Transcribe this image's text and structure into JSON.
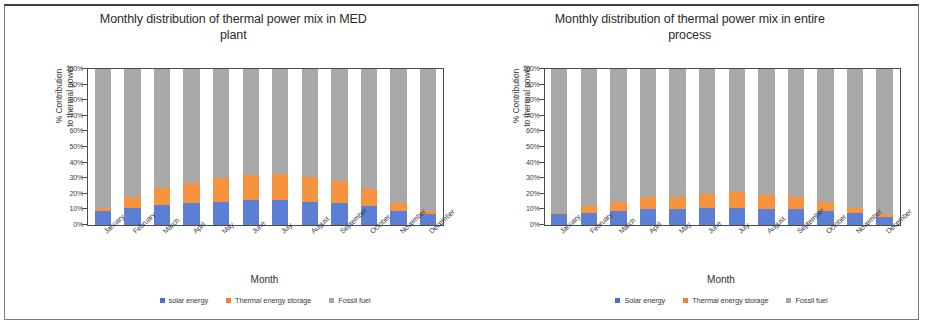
{
  "figure": {
    "panels": [
      {
        "id": "med-plant",
        "title": "Monthly distribution of thermal power mix in MED plant",
        "title_line1": "Monthly distribution of thermal power mix in MED",
        "title_line2": "plant",
        "ylabel_line1": "% Contribution",
        "ylabel_line2": "to thermal power",
        "xlabel": "Month",
        "legend": [
          {
            "label": "solar energy",
            "color": "#4a6fc8"
          },
          {
            "label": "Thermal energy storage",
            "color": "#ef7f33"
          },
          {
            "label": "Fossil fuel",
            "color": "#a8a8a8"
          }
        ]
      },
      {
        "id": "entire-process",
        "title": "Monthly distribution of thermal power mix in entire process",
        "title_line1": "Monthly distribution of thermal power mix in entire",
        "title_line2": "process",
        "ylabel_line1": "% Contribution",
        "ylabel_line2": "to thermal power",
        "xlabel": "Month",
        "legend": [
          {
            "label": "Solar energy",
            "color": "#4a6fc8"
          },
          {
            "label": "Thermal energy storage",
            "color": "#ef7f33"
          },
          {
            "label": "Fossil fuel",
            "color": "#a8a8a8"
          }
        ]
      }
    ],
    "yticks": [
      "100%",
      "90%",
      "80%",
      "70%",
      "60%",
      "50%",
      "40%",
      "30%",
      "20%",
      "10%",
      "0%"
    ]
  },
  "chart_data": [
    {
      "type": "bar",
      "stacked": true,
      "normalized": true,
      "title": "Monthly distribution of thermal power mix in MED plant",
      "xlabel": "Month",
      "ylabel": "% Contribution to thermal power",
      "ylim": [
        0,
        100
      ],
      "ytick_step": 10,
      "grid": false,
      "legend_position": "bottom",
      "categories": [
        "January",
        "February",
        "March",
        "April",
        "May",
        "June",
        "July",
        "August",
        "September",
        "October",
        "November",
        "December"
      ],
      "series": [
        {
          "name": "solar energy",
          "color": "#5b7fd4",
          "values": [
            9,
            11,
            13,
            14,
            15,
            16,
            16,
            15,
            14,
            12,
            9,
            7
          ]
        },
        {
          "name": "Thermal energy storage",
          "color": "#f7923f",
          "values": [
            2,
            7,
            11,
            13,
            15,
            16,
            17,
            16,
            14,
            11,
            5,
            2
          ]
        },
        {
          "name": "Fossil fuel",
          "color": "#a8a8a8",
          "values": [
            89,
            82,
            76,
            73,
            70,
            68,
            67,
            69,
            72,
            77,
            86,
            91
          ]
        }
      ]
    },
    {
      "type": "bar",
      "stacked": true,
      "normalized": true,
      "title": "Monthly distribution of thermal power mix in entire process",
      "xlabel": "Month",
      "ylabel": "% Contribution to thermal power",
      "ylim": [
        0,
        100
      ],
      "ytick_step": 10,
      "grid": false,
      "legend_position": "bottom",
      "categories": [
        "January",
        "February",
        "March",
        "April",
        "May",
        "June",
        "July",
        "August",
        "September",
        "October",
        "November",
        "December"
      ],
      "series": [
        {
          "name": "Solar energy",
          "color": "#5b7fd4",
          "values": [
            7,
            8,
            9,
            10,
            10,
            11,
            11,
            10,
            10,
            9,
            8,
            5
          ]
        },
        {
          "name": "Thermal energy storage",
          "color": "#f7923f",
          "values": [
            1,
            4,
            6,
            8,
            8,
            9,
            10,
            9,
            8,
            6,
            3,
            2
          ]
        },
        {
          "name": "Fossil fuel",
          "color": "#a8a8a8",
          "values": [
            92,
            88,
            85,
            82,
            82,
            80,
            79,
            81,
            82,
            85,
            89,
            93
          ]
        }
      ]
    }
  ]
}
